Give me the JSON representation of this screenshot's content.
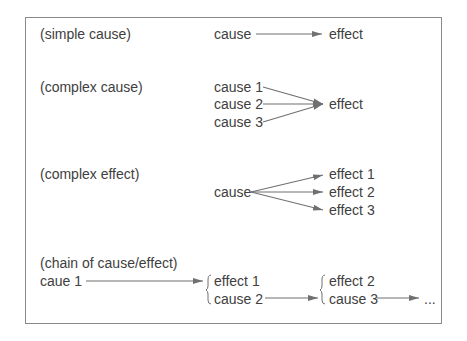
{
  "diagram": {
    "sections": [
      {
        "label": "(simple cause)",
        "causes": [
          "cause"
        ],
        "effects": [
          "effect"
        ]
      },
      {
        "label": "(complex cause)",
        "causes": [
          "cause 1",
          "cause 2",
          "cause 3"
        ],
        "effects": [
          "effect"
        ]
      },
      {
        "label": "(complex effect)",
        "causes": [
          "cause"
        ],
        "effects": [
          "effect 1",
          "effect 2",
          "effect 3"
        ]
      },
      {
        "label": "(chain of cause/effect)",
        "start": "caue 1",
        "links": [
          {
            "effect": "effect 1",
            "cause": "cause 2"
          },
          {
            "effect": "effect 2",
            "cause": "cause 3"
          }
        ],
        "ellipsis": "..."
      }
    ],
    "colors": {
      "text": "#404040",
      "arrow": "#707070",
      "border": "#8a8a8a",
      "background": "#ffffff"
    }
  }
}
